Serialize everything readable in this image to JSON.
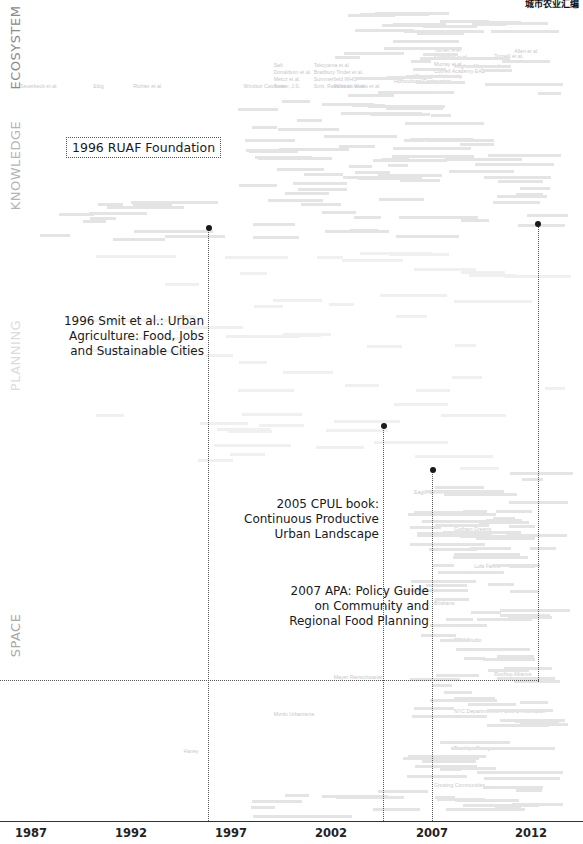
{
  "corner_text": "城市农业汇编",
  "chart_data": {
    "type": "scatter",
    "title": "",
    "xlabel": "",
    "ylabel": "",
    "x_ticks": [
      "1987",
      "1992",
      "1997",
      "2002",
      "2007",
      "2012"
    ],
    "xlim": [
      1986,
      2014
    ],
    "grid": false,
    "legend": null,
    "bands": [
      {
        "name": "ECOSYSTEM",
        "y_top": 0,
        "y_bottom": 95,
        "color": "#8a8a8a"
      },
      {
        "name": "KNOWLEDGE",
        "y_top": 95,
        "y_bottom": 245,
        "color": "#b5b5b5"
      },
      {
        "name": "PLANNING",
        "y_top": 245,
        "y_bottom": 470,
        "color": "#dcdcdc"
      },
      {
        "name": "SPACE",
        "y_top": 470,
        "y_bottom": 821,
        "color": "#a8a8a8"
      }
    ],
    "milestones": [
      {
        "year": 1996,
        "label": "1996 RUAF Foundation",
        "band": "KNOWLEDGE",
        "boxed": true
      },
      {
        "year": 1996,
        "label": "1996 Smit et al.: Urban Agriculture: Food, Jobs and Sustainable Cities",
        "band": "PLANNING"
      },
      {
        "year": 2005,
        "label": "2005 CPUL book: Continuous Productive Urban Landscape",
        "band": "SPACE"
      },
      {
        "year": 2007,
        "label": "2007 APA: Policy Guide on Community and Regional Food Planning",
        "band": "SPACE"
      },
      {
        "year": 2012,
        "label": "",
        "band": "KNOWLEDGE"
      }
    ],
    "publication_names_sample": [
      {
        "name": "Seuerbeck et al.",
        "year": 1987,
        "band": "ECOSYSTEM"
      },
      {
        "name": "Ettig",
        "year": 1991,
        "band": "ECOSYSTEM"
      },
      {
        "name": "Richter et al.",
        "year": 1993,
        "band": "ECOSYSTEM"
      },
      {
        "name": "Windsor Cassman",
        "year": 1998.5,
        "band": "ECOSYSTEM"
      },
      {
        "name": "Turner, J.S.",
        "year": 2000,
        "band": "ECOSYSTEM"
      },
      {
        "name": "Metcz et al.",
        "year": 2000,
        "band": "ECOSYSTEM"
      },
      {
        "name": "Donaldson et al.",
        "year": 2000,
        "band": "ECOSYSTEM"
      },
      {
        "name": "Salt",
        "year": 2000,
        "band": "ECOSYSTEM"
      },
      {
        "name": "Smit, Ratta et al.",
        "year": 2002,
        "band": "ECOSYSTEM"
      },
      {
        "name": "Summerfield WHO",
        "year": 2002,
        "band": "ECOSYSTEM"
      },
      {
        "name": "Bradbury Tinder et al.",
        "year": 2002,
        "band": "ECOSYSTEM"
      },
      {
        "name": "Williams et al.",
        "year": 2003,
        "band": "ECOSYSTEM"
      },
      {
        "name": "Tokoyama et al.",
        "year": 2002,
        "band": "ECOSYSTEM"
      },
      {
        "name": "Weiss et al.",
        "year": 2004,
        "band": "ECOSYSTEM"
      },
      {
        "name": "Horticultural Engineering",
        "year": 2006,
        "band": "ECOSYSTEM"
      },
      {
        "name": "Worcester University",
        "year": 2007,
        "band": "ECOSYSTEM"
      },
      {
        "name": "Cornell Academy EAD",
        "year": 2008,
        "band": "ECOSYSTEM"
      },
      {
        "name": "Murray et al.",
        "year": 2008,
        "band": "ECOSYSTEM"
      },
      {
        "name": "Stefanelli et al.",
        "year": 2008,
        "band": "ECOSYSTEM"
      },
      {
        "name": "Hughes-Meyer et al.",
        "year": 2009,
        "band": "ECOSYSTEM"
      },
      {
        "name": "Turner, A.H.",
        "year": 2008,
        "band": "ECOSYSTEM"
      },
      {
        "name": "Tornelli et al.",
        "year": 2011,
        "band": "ECOSYSTEM"
      },
      {
        "name": "Allen et al.",
        "year": 2012,
        "band": "ECOSYSTEM"
      },
      {
        "name": "Rooftop Alliance",
        "year": 2011,
        "band": "SPACE"
      },
      {
        "name": "NYC Department of Parks & Recreation",
        "year": 2009,
        "band": "SPACE"
      },
      {
        "name": "Brooklyn Grange",
        "year": 2009,
        "band": "SPACE"
      },
      {
        "name": "Growing Communities",
        "year": 2008,
        "band": "SPACE"
      },
      {
        "name": "Eagle Street Rooftop Farm",
        "year": 2007,
        "band": "SPACE"
      },
      {
        "name": "Gotham Greens",
        "year": 2009,
        "band": "SPACE"
      },
      {
        "name": "Lufa Farms",
        "year": 2010,
        "band": "SPACE"
      },
      {
        "name": "Brisbane",
        "year": 2008,
        "band": "SPACE"
      },
      {
        "name": "BBM Studio",
        "year": 2009,
        "band": "SPACE"
      },
      {
        "name": "Mayer Reinschwaner",
        "year": 2003,
        "band": "SPACE"
      },
      {
        "name": "Mvrdv Urbanisme",
        "year": 2000,
        "band": "SPACE"
      },
      {
        "name": "Haney",
        "year": 1995.5,
        "band": "SPACE"
      }
    ]
  },
  "guide_lines": {
    "horizontal_y_px": 680
  }
}
